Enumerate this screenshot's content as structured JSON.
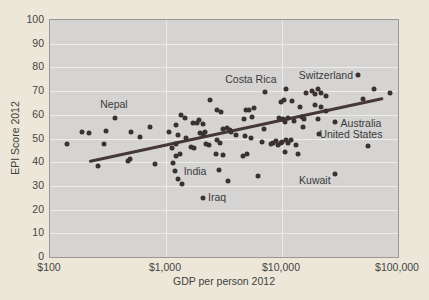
{
  "chart_data": {
    "type": "scatter",
    "title": "",
    "xlabel": "GDP per person 2012",
    "ylabel": "EPI Score 2012",
    "x_scale": "log",
    "xlim": [
      100,
      100000
    ],
    "ylim": [
      0,
      100
    ],
    "x_ticks": [
      {
        "value": 100,
        "label": "$100"
      },
      {
        "value": 1000,
        "label": "$1,000"
      },
      {
        "value": 10000,
        "label": "$10,000"
      },
      {
        "value": 100000,
        "label": "$100,000"
      }
    ],
    "y_ticks": [
      0,
      10,
      20,
      30,
      40,
      50,
      60,
      70,
      80,
      90,
      100
    ],
    "x_gridlines": [
      1000,
      10000
    ],
    "grid": true,
    "legend": "none",
    "points": [
      [
        140,
        47.7
      ],
      [
        189,
        52.7
      ],
      [
        217,
        52.3
      ],
      [
        259,
        38.4
      ],
      [
        292,
        47.7
      ],
      [
        304,
        53.2
      ],
      [
        364,
        58.6
      ],
      [
        500,
        52.7
      ],
      [
        598,
        50.6
      ],
      [
        730,
        54.9
      ],
      [
        470,
        40.5
      ],
      [
        489,
        41.4
      ],
      [
        803,
        39.2
      ],
      [
        1060,
        52.7
      ],
      [
        1150,
        39.7
      ],
      [
        1220,
        55.7
      ],
      [
        1220,
        47.7
      ],
      [
        1130,
        46.0
      ],
      [
        1270,
        51.5
      ],
      [
        1350,
        59.9
      ],
      [
        1460,
        58.6
      ],
      [
        1490,
        50.2
      ],
      [
        1650,
        46.4
      ],
      [
        1710,
        56.5
      ],
      [
        1750,
        46.0
      ],
      [
        1850,
        56.5
      ],
      [
        1930,
        57.8
      ],
      [
        1970,
        52.3
      ],
      [
        2070,
        56.1
      ],
      [
        2070,
        51.9
      ],
      [
        2160,
        52.7
      ],
      [
        2210,
        47.7
      ],
      [
        2340,
        47.3
      ],
      [
        2390,
        66.2
      ],
      [
        1220,
        42.6
      ],
      [
        1320,
        43.5
      ],
      [
        1200,
        36.3
      ],
      [
        1270,
        32.9
      ],
      [
        1370,
        30.8
      ],
      [
        2760,
        62.0
      ],
      [
        3000,
        61.2
      ],
      [
        2760,
        49.4
      ],
      [
        2930,
        48.1
      ],
      [
        3130,
        54.0
      ],
      [
        3330,
        54.4
      ],
      [
        3570,
        53.6
      ],
      [
        3630,
        52.7
      ],
      [
        4010,
        51.5
      ],
      [
        2700,
        43.5
      ],
      [
        3130,
        43.0
      ],
      [
        2080,
        24.9
      ],
      [
        2860,
        36.7
      ],
      [
        3420,
        32.1
      ],
      [
        4610,
        42.6
      ],
      [
        4700,
        58.2
      ],
      [
        4890,
        62.0
      ],
      [
        4990,
        43.5
      ],
      [
        5190,
        62.0
      ],
      [
        5420,
        50.2
      ],
      [
        5520,
        59.1
      ],
      [
        5740,
        62.9
      ],
      [
        4790,
        51.1
      ],
      [
        6220,
        34.2
      ],
      [
        6740,
        48.5
      ],
      [
        7010,
        54.0
      ],
      [
        7150,
        69.6
      ],
      [
        8060,
        47.7
      ],
      [
        8390,
        48.1
      ],
      [
        8880,
        48.9
      ],
      [
        9220,
        47.3
      ],
      [
        9400,
        58.6
      ],
      [
        9780,
        65.4
      ],
      [
        9780,
        48.1
      ],
      [
        9980,
        48.5
      ],
      [
        10200,
        58.2
      ],
      [
        10400,
        66.2
      ],
      [
        10600,
        57.0
      ],
      [
        10800,
        70.9
      ],
      [
        10800,
        49.4
      ],
      [
        11200,
        48.1
      ],
      [
        11200,
        58.6
      ],
      [
        12000,
        49.4
      ],
      [
        12200,
        65.8
      ],
      [
        12700,
        57.4
      ],
      [
        13200,
        47.3
      ],
      [
        13700,
        43.5
      ],
      [
        10600,
        44.3
      ],
      [
        14300,
        63.3
      ],
      [
        15000,
        59.1
      ],
      [
        15200,
        54.9
      ],
      [
        15500,
        58.2
      ],
      [
        16200,
        69.2
      ],
      [
        18200,
        70.0
      ],
      [
        19200,
        68.8
      ],
      [
        19200,
        64.1
      ],
      [
        20400,
        70.9
      ],
      [
        21700,
        69.2
      ],
      [
        21700,
        63.3
      ],
      [
        20400,
        58.2
      ],
      [
        24000,
        67.9
      ],
      [
        24000,
        61.6
      ],
      [
        20900,
        51.9
      ],
      [
        28700,
        57.0
      ],
      [
        28700,
        35.0
      ],
      [
        45200,
        76.8
      ],
      [
        49700,
        66.7
      ],
      [
        54900,
        46.8
      ],
      [
        62100,
        70.9
      ],
      [
        85400,
        69.2
      ]
    ],
    "annotations": [
      {
        "label": "Nepal",
        "x": 356,
        "y": 64.6
      },
      {
        "label": "India",
        "x": 1780,
        "y": 36.3
      },
      {
        "label": "Iraq",
        "x": 2760,
        "y": 25.3
      },
      {
        "label": "Costa Rica",
        "x": 5400,
        "y": 74.9
      },
      {
        "label": "Kuwait",
        "x": 19200,
        "y": 32.5
      },
      {
        "label": "Switzerland",
        "x": 23900,
        "y": 76.9
      },
      {
        "label": "Australia",
        "x": 48000,
        "y": 56.7
      },
      {
        "label": "United States",
        "x": 39300,
        "y": 51.9
      }
    ],
    "trendline": {
      "x1": 217,
      "y1": 40.1,
      "x2": 74400,
      "y2": 66.7
    },
    "colors": {
      "background": "#ece7d8",
      "plot_background": "#d5d4d2",
      "plot_border": "#9b9892",
      "gridline": "#ebebe9",
      "point": "#3a3132",
      "trendline": "#463839",
      "text": "#454545",
      "annotation_text": "#3a3a3a"
    }
  }
}
